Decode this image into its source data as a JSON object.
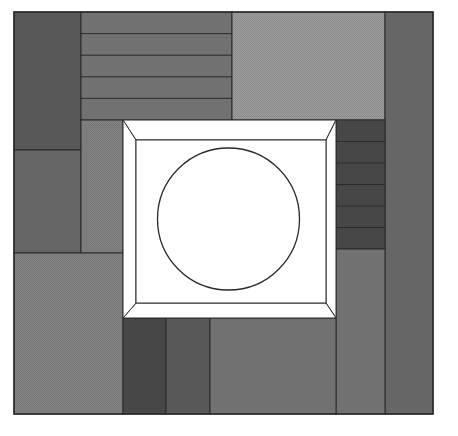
{
  "diagram": {
    "title": "",
    "colors": {
      "background": "#ffffff",
      "outline": "#2a2a2a",
      "frame_fill": "#ffffff",
      "circle_fill": "#ffffff",
      "darkest": "#4a4a4a",
      "dark": "#5c5c5c",
      "mid_dark": "#6a6a6a",
      "mid": "#767676",
      "mid_light": "#828282",
      "light": "#9a9a9a"
    },
    "blocks": [
      {
        "name": "top-left-square",
        "shade": "dark"
      },
      {
        "name": "top-striped-band",
        "shade": "mid",
        "stripes": 5
      },
      {
        "name": "top-right-light-panel",
        "shade": "light"
      },
      {
        "name": "right-column",
        "shade": "mid_dark"
      },
      {
        "name": "left-middle-block",
        "shade": "mid_dark"
      },
      {
        "name": "left-inner-strip",
        "shade": "mid_light"
      },
      {
        "name": "left-bottom-block",
        "shade": "mid_light"
      },
      {
        "name": "right-striped-block",
        "shade": "darkest",
        "stripes": 6
      },
      {
        "name": "right-inner-column",
        "shade": "mid"
      },
      {
        "name": "bottom-left-strip-1",
        "shade": "darkest"
      },
      {
        "name": "bottom-left-strip-2",
        "shade": "dark"
      },
      {
        "name": "bottom-middle-block",
        "shade": "mid"
      }
    ],
    "center": {
      "frame": "bevelled-frame",
      "shape": "circle"
    }
  }
}
